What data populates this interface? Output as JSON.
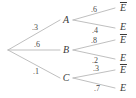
{
  "figure": {
    "type": "probability-tree-diagram",
    "width": 136,
    "height": 98,
    "line_color": "#b8b8b8",
    "text_color": "#3a3a3a",
    "background": "#ffffff"
  },
  "root": {
    "label": "",
    "x": 8,
    "y": 50
  },
  "stage1": {
    "nodes": [
      {
        "name": "A",
        "label": "A",
        "x": 66,
        "y": 20,
        "prob": ".3",
        "prob_x": 35,
        "prob_y": 28
      },
      {
        "name": "B",
        "label": "B",
        "x": 66,
        "y": 50,
        "prob": ".6",
        "prob_x": 37,
        "prob_y": 45
      },
      {
        "name": "C",
        "label": "C",
        "x": 66,
        "y": 78,
        "prob": ".1",
        "prob_x": 36,
        "prob_y": 72
      }
    ]
  },
  "stage2": {
    "branches": [
      {
        "parent": "A",
        "prob": ".6",
        "prob_x": 94,
        "prob_y": 10,
        "outcome": "E",
        "complement": true,
        "out_x": 123,
        "out_y": 8
      },
      {
        "parent": "A",
        "prob": ".4",
        "prob_x": 95,
        "prob_y": 31,
        "outcome": "E",
        "complement": false,
        "out_x": 123,
        "out_y": 27
      },
      {
        "parent": "B",
        "prob": ".8",
        "prob_x": 94,
        "prob_y": 41,
        "outcome": "E",
        "complement": true,
        "out_x": 123,
        "out_y": 40
      },
      {
        "parent": "B",
        "prob": ".2",
        "prob_x": 95,
        "prob_y": 61,
        "outcome": "E",
        "complement": false,
        "out_x": 123,
        "out_y": 58
      },
      {
        "parent": "C",
        "prob": ".3",
        "prob_x": 96,
        "prob_y": 69,
        "outcome": "E",
        "complement": true,
        "out_x": 123,
        "out_y": 70
      },
      {
        "parent": "C",
        "prob": ".7",
        "prob_x": 97,
        "prob_y": 89,
        "outcome": "E",
        "complement": false,
        "out_x": 123,
        "out_y": 88
      }
    ]
  },
  "edges": {
    "stage1": [
      {
        "name": "edge-root-A",
        "x1": 8,
        "y1": 50,
        "x2": 60,
        "y2": 20
      },
      {
        "name": "edge-root-B",
        "x1": 8,
        "y1": 50,
        "x2": 60,
        "y2": 50
      },
      {
        "name": "edge-root-C",
        "x1": 8,
        "y1": 50,
        "x2": 60,
        "y2": 78
      }
    ],
    "stage2": [
      {
        "name": "edge-A-Ebar",
        "x1": 73,
        "y1": 20,
        "x2": 115,
        "y2": 8
      },
      {
        "name": "edge-A-E",
        "x1": 73,
        "y1": 20,
        "x2": 115,
        "y2": 28
      },
      {
        "name": "edge-B-Ebar",
        "x1": 73,
        "y1": 50,
        "x2": 115,
        "y2": 40
      },
      {
        "name": "edge-B-E",
        "x1": 73,
        "y1": 50,
        "x2": 115,
        "y2": 59
      },
      {
        "name": "edge-C-Ebar",
        "x1": 73,
        "y1": 78,
        "x2": 115,
        "y2": 70
      },
      {
        "name": "edge-C-E",
        "x1": 73,
        "y1": 78,
        "x2": 115,
        "y2": 88
      }
    ]
  }
}
